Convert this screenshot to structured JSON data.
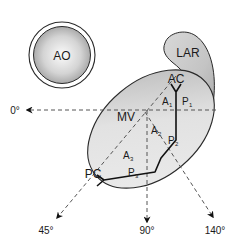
{
  "diagram": {
    "structures": {
      "aorta": {
        "label": "AO"
      },
      "left_atrial_roof": {
        "label": "LAR"
      },
      "mitral_valve": {
        "label": "MV"
      },
      "anterior_commissure": {
        "label": "AC"
      },
      "posterior_commissure": {
        "label": "PC"
      }
    },
    "scallops": {
      "anterior": [
        {
          "letter": "A",
          "sub": "1"
        },
        {
          "letter": "A",
          "sub": "2"
        },
        {
          "letter": "A",
          "sub": "3"
        }
      ],
      "posterior": [
        {
          "letter": "P",
          "sub": "1"
        },
        {
          "letter": "P",
          "sub": "2"
        },
        {
          "letter": "P",
          "sub": "3"
        }
      ]
    },
    "angles": [
      {
        "label": "0°"
      },
      {
        "label": "45°"
      },
      {
        "label": "90°"
      },
      {
        "label": "140°"
      }
    ],
    "colors": {
      "outline": "#2a2a2a",
      "fill_light": "#f4f4f4",
      "fill_dark": "#a8a8a8",
      "dash": "#555555"
    }
  }
}
